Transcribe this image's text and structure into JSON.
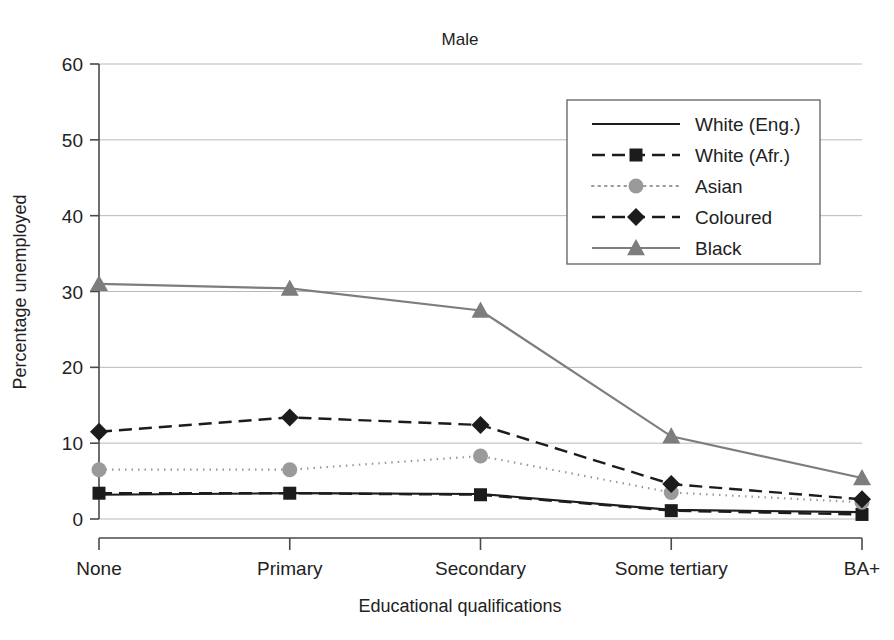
{
  "chart_data": {
    "type": "line",
    "title": "Male",
    "xlabel": "Educational qualifications",
    "ylabel": "Percentage unemployed",
    "categories": [
      "None",
      "Primary",
      "Secondary",
      "Some tertiary",
      "BA+"
    ],
    "ylim": [
      0,
      60
    ],
    "yticks": [
      0,
      10,
      20,
      30,
      40,
      50,
      60
    ],
    "ytick_labels": [
      "0",
      "10",
      "20",
      "30",
      "40",
      "50",
      "60"
    ],
    "grid": true,
    "legend_position": "upper right",
    "series": [
      {
        "name": "White (Eng.)",
        "values": [
          3.2,
          3.4,
          3.3,
          1.2,
          0.9
        ],
        "color": "#1c1c1c",
        "dash": "none",
        "marker": "none",
        "width": 2.2
      },
      {
        "name": "White (Afr.)",
        "values": [
          3.4,
          3.4,
          3.2,
          1.1,
          0.6
        ],
        "color": "#1c1c1c",
        "dash": "dashed",
        "marker": "square",
        "width": 2.4
      },
      {
        "name": "Asian",
        "values": [
          6.5,
          6.5,
          8.3,
          3.5,
          2.2
        ],
        "color": "#9a9a9a",
        "dash": "dotted",
        "marker": "circle",
        "width": 2.2
      },
      {
        "name": "Coloured",
        "values": [
          11.5,
          13.4,
          12.4,
          4.6,
          2.6
        ],
        "color": "#1c1c1c",
        "dash": "dashed",
        "marker": "diamond",
        "width": 2.4
      },
      {
        "name": "Black",
        "values": [
          31.0,
          30.4,
          27.5,
          10.9,
          5.4
        ],
        "color": "#7d7d7d",
        "dash": "none",
        "marker": "triangle",
        "width": 2.2
      }
    ]
  }
}
